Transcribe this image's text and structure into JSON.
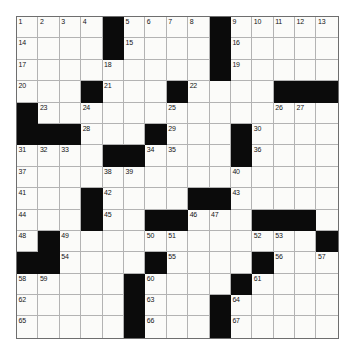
{
  "puzzle": {
    "title": "Crossword Grid",
    "rows": 15,
    "cols": 15,
    "colors": {
      "block": "#0b0b0b",
      "cell": "#fbfbf9",
      "gridline": "#b3b3b3",
      "border": "#6e6e6e",
      "number": "#141414",
      "page_background": "#ffffff"
    },
    "layout": [
      [
        "1",
        "2",
        "3",
        "4",
        "#",
        "5",
        "6",
        "7",
        "8",
        "#",
        "9",
        "10",
        "11",
        "12",
        "13"
      ],
      [
        "14",
        "",
        "",
        "",
        "#",
        "15",
        "",
        "",
        "",
        "#",
        "16",
        "",
        "",
        "",
        ""
      ],
      [
        "17",
        "",
        "",
        "",
        "18",
        "",
        "",
        "",
        "",
        "#",
        "19",
        "",
        "",
        "",
        ""
      ],
      [
        "20",
        "",
        "",
        "#",
        "21",
        "",
        "",
        "#",
        "22",
        "",
        "",
        "",
        "#",
        "#",
        "#"
      ],
      [
        "#",
        "23",
        "",
        "24",
        "",
        "",
        "",
        "25",
        "",
        "",
        "",
        "",
        "26",
        "27",
        ""
      ],
      [
        "#",
        "#",
        "#",
        "28",
        "",
        "",
        "#",
        "29",
        "",
        "",
        "#",
        "30",
        "",
        "",
        ""
      ],
      [
        "31",
        "32",
        "33",
        "",
        "#",
        "#",
        "34",
        "35",
        "",
        "",
        "#",
        "36",
        "",
        "",
        ""
      ],
      [
        "37",
        "",
        "",
        "",
        "38",
        "39",
        "",
        "",
        "",
        "",
        "40",
        "",
        "",
        "",
        ""
      ],
      [
        "41",
        "",
        "",
        "#",
        "42",
        "",
        "",
        "",
        "#",
        "#",
        "43",
        "",
        "",
        "",
        ""
      ],
      [
        "44",
        "",
        "",
        "#",
        "45",
        "",
        "#",
        "#",
        "46",
        "47",
        "",
        "#",
        "#",
        "#",
        ""
      ],
      [
        "48",
        "#",
        "49",
        "",
        "",
        "",
        "50",
        "51",
        "",
        "",
        "",
        "52",
        "53",
        "",
        "#"
      ],
      [
        "#",
        "#",
        "54",
        "",
        "",
        "",
        "#",
        "55",
        "",
        "",
        "",
        "#",
        "56",
        "",
        "57"
      ],
      [
        "58",
        "59",
        "",
        "",
        "",
        "#",
        "60",
        "",
        "",
        "",
        "#",
        "61",
        "",
        "",
        ""
      ],
      [
        "62",
        "",
        "",
        "",
        "",
        "#",
        "63",
        "",
        "",
        "#",
        "64",
        "",
        "",
        "",
        ""
      ],
      [
        "65",
        "",
        "",
        "",
        "",
        "#",
        "66",
        "",
        "",
        "#",
        "67",
        "",
        "",
        "",
        ""
      ]
    ]
  }
}
